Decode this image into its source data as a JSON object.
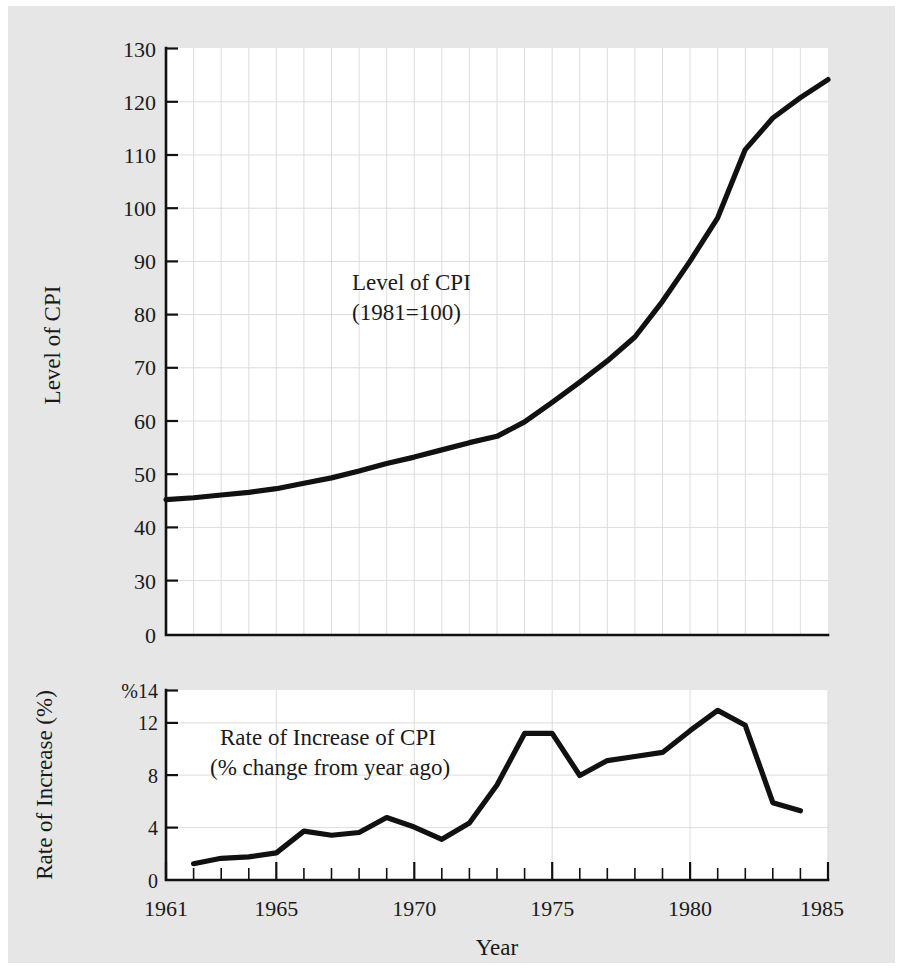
{
  "figure": {
    "background_color": "#e6e6e6",
    "plot_background_color": "#ffffff",
    "line_color": "#111111",
    "grid_color": "#d9d9d9",
    "xlabel": "Year"
  },
  "chart_data": [
    {
      "type": "line",
      "id": "cpi-level",
      "title": "",
      "annotation_line1": "Level of CPI",
      "annotation_line2": "(1981=100)",
      "xlabel": "Year",
      "ylabel": "Level of CPI",
      "xlim": [
        1961,
        1985
      ],
      "ylim": [
        0,
        130
      ],
      "grid": true,
      "legend_position": "none",
      "ytick_labels": [
        "130",
        "120",
        "110",
        "100",
        "90",
        "80",
        "70",
        "60",
        "50",
        "40",
        "30",
        "0"
      ],
      "ytick_values": [
        130,
        120,
        110,
        100,
        90,
        80,
        70,
        60,
        50,
        40,
        30,
        0
      ],
      "xtick_labels": [
        "1961",
        "1965",
        "1970",
        "1975",
        "1980",
        "1985"
      ],
      "xtick_values": [
        1961,
        1965,
        1970,
        1975,
        1980,
        1985
      ],
      "x": [
        1961,
        1962,
        1963,
        1964,
        1965,
        1966,
        1967,
        1968,
        1969,
        1970,
        1971,
        1972,
        1973,
        1974,
        1975,
        1976,
        1977,
        1978,
        1979,
        1980,
        1981,
        1982,
        1983,
        1984
      ],
      "values": [
        30.0,
        30.4,
        31.0,
        31.6,
        32.4,
        33.6,
        34.8,
        36.3,
        38.0,
        39.4,
        41.0,
        42.6,
        44.0,
        47.2,
        51.5,
        56.0,
        60.7,
        66.0,
        73.9,
        82.8,
        92.4,
        107.5,
        114.5,
        119.0
      ],
      "last_point": 123.0
    },
    {
      "type": "line",
      "id": "cpi-rate-of-increase",
      "title": "",
      "annotation_line1": "Rate of Increase of CPI",
      "annotation_line2": "(% change from year ago)",
      "xlabel": "Year",
      "ylabel": "Rate of Increase (%)",
      "xlim": [
        1961,
        1985
      ],
      "ylim": [
        0,
        14
      ],
      "grid": true,
      "legend_position": "none",
      "ytick_labels": [
        "%14",
        "12",
        "8",
        "4",
        "0"
      ],
      "ytick_values": [
        14,
        12,
        8,
        4,
        0
      ],
      "xtick_labels": [
        "1961",
        "1965",
        "1970",
        "1975",
        "1980",
        "1985"
      ],
      "xtick_values": [
        1961,
        1965,
        1970,
        1975,
        1980,
        1985
      ],
      "x": [
        1962,
        1963,
        1964,
        1965,
        1966,
        1967,
        1968,
        1969,
        1970,
        1971,
        1972,
        1973,
        1974,
        1975,
        1976,
        1977,
        1978,
        1979,
        1980,
        1981,
        1982,
        1983,
        1984
      ],
      "values": [
        1.2,
        1.6,
        1.7,
        2.0,
        3.6,
        3.3,
        3.5,
        4.6,
        3.9,
        3.0,
        4.2,
        7.0,
        10.8,
        10.8,
        7.7,
        8.8,
        9.1,
        9.4,
        11.0,
        12.5,
        11.4,
        5.7,
        5.1
      ]
    }
  ]
}
